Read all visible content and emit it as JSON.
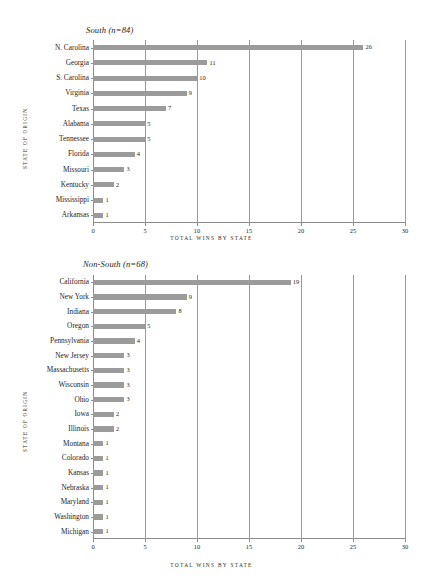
{
  "figure": {
    "bar_color": "#9b9b9b",
    "axis_color": "#8c8c8c",
    "grid_color": "#9a9a9a",
    "text_color": "#1e1e1e",
    "background": "#ffffff"
  },
  "chart_data": [
    {
      "type": "bar",
      "orientation": "horizontal",
      "title": "South (n=84)",
      "xlabel": "TOTAL WINS BY STATE",
      "ylabel": "STATE OF ORIGIN",
      "xlim": [
        0,
        30
      ],
      "xticks": [
        0,
        5,
        10,
        15,
        20,
        25,
        30
      ],
      "xticklabels": [
        "0",
        "5",
        "10",
        "15",
        "20",
        "25",
        "30"
      ],
      "grid": "vertical",
      "legend": "none",
      "categories": [
        "N. Carolina",
        "Georgia",
        "S. Carolina",
        "Virginia",
        "Texas",
        "Alabama",
        "Tennessee",
        "Florida",
        "Missouri",
        "Kentucky",
        "Mississippi",
        "Arkansas"
      ],
      "values": [
        26,
        11,
        10,
        9,
        7,
        5,
        5,
        4,
        3,
        2,
        1,
        1
      ],
      "data_labels": [
        "26",
        "11",
        "10",
        "9",
        "7",
        "5",
        "5",
        "4",
        "3",
        "2",
        "1",
        "1"
      ],
      "total": 84
    },
    {
      "type": "bar",
      "orientation": "horizontal",
      "title": "Non-South (n=68)",
      "xlabel": "TOTAL WINS BY STATE",
      "ylabel": "STATE OF ORIGIN",
      "xlim": [
        0,
        30
      ],
      "xticks": [
        0,
        5,
        10,
        15,
        20,
        25,
        30
      ],
      "xticklabels": [
        "0",
        "5",
        "10",
        "15",
        "20",
        "25",
        "30"
      ],
      "grid": "vertical",
      "legend": "none",
      "categories": [
        "California",
        "New York",
        "Indiana",
        "Oregon",
        "Pennsylvania",
        "New Jersey",
        "Massachusetts",
        "Wisconsin",
        "Ohio",
        "Iowa",
        "Illinois",
        "Montana",
        "Colorado",
        "Kansas",
        "Nebraska",
        "Maryland",
        "Washington",
        "Michigan"
      ],
      "values": [
        19,
        9,
        8,
        5,
        4,
        3,
        3,
        3,
        3,
        2,
        2,
        1,
        1,
        1,
        1,
        1,
        1,
        1
      ],
      "data_labels": [
        "19",
        "9",
        "8",
        "5",
        "4",
        "3",
        "3",
        "3",
        "3",
        "2",
        "2",
        "1",
        "1",
        "1",
        "1",
        "1",
        "1",
        "1"
      ],
      "total": 68
    }
  ]
}
